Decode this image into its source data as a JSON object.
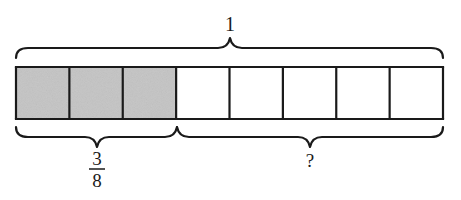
{
  "diagram": {
    "type": "tape-diagram",
    "whole_label": "1",
    "total_parts": 8,
    "shaded_parts": 3,
    "shaded_label": {
      "numerator": "3",
      "denominator": "8"
    },
    "unknown_label": "?",
    "colors": {
      "shaded_fill": "#c4c4c4",
      "unshaded_fill": "#ffffff",
      "stroke": "#1a1a1a"
    }
  }
}
